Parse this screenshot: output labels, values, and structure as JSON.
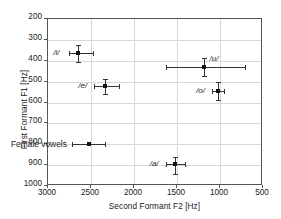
{
  "chart_data": {
    "type": "scatter",
    "title": "",
    "xlabel": "Second Formant F2 [Hz]",
    "ylabel": "First Formant F1 [Hz]",
    "xlim": [
      3000,
      500
    ],
    "ylim": [
      1000,
      200
    ],
    "x_inverted": true,
    "y_inverted": true,
    "grid": true,
    "xticks": [
      3000,
      2500,
      2000,
      1500,
      1000,
      500
    ],
    "yticks": [
      200,
      300,
      400,
      500,
      600,
      700,
      800,
      900,
      1000
    ],
    "xtick_labels": [
      "3000",
      "2500",
      "2000",
      "1500",
      "1000",
      "500"
    ],
    "ytick_labels": [
      "200",
      "300",
      "400",
      "500",
      "600",
      "700",
      "800",
      "900",
      "1000"
    ],
    "legend": {
      "position": "lower-left-inside",
      "entries": [
        {
          "name": "Female vowels",
          "marker": "square-with-errorbars"
        }
      ]
    },
    "series": [
      {
        "name": "Female vowels",
        "marker": "square",
        "color": "#111111",
        "points": [
          {
            "label": "/i/",
            "f2": 2640,
            "f1": 370,
            "f2_err_low": 2740,
            "f2_err_high": 2470,
            "f1_err_low": 330,
            "f1_err_high": 410,
            "label_side": "left"
          },
          {
            "label": "/e/",
            "f2": 2320,
            "f1": 525,
            "f2_err_low": 2450,
            "f2_err_high": 2160,
            "f1_err_low": 490,
            "f1_err_high": 565,
            "label_side": "left"
          },
          {
            "label": "/a/",
            "f2": 1510,
            "f1": 900,
            "f2_err_low": 1620,
            "f2_err_high": 1390,
            "f1_err_low": 865,
            "f1_err_high": 945,
            "label_side": "left"
          },
          {
            "label": "/o/",
            "f2": 1010,
            "f1": 548,
            "f2_err_low": 1080,
            "f2_err_high": 940,
            "f1_err_low": 505,
            "f1_err_high": 595,
            "label_side": "left"
          },
          {
            "label": "/u/",
            "f2": 1180,
            "f1": 437,
            "f2_err_low": 1620,
            "f2_err_high": 700,
            "f1_err_low": 393,
            "f1_err_high": 480,
            "label_side": "right"
          }
        ]
      }
    ]
  },
  "legend_label": "Female vowels"
}
